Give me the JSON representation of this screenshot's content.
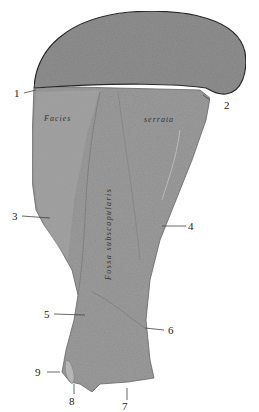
{
  "figure": {
    "colors": {
      "background": "#ffffff",
      "bone_surface": "#9a9a9a",
      "bone_surface_light": "#b0b0b0",
      "cap_surface": "#8d8d8d",
      "outline": "#2a2a2a",
      "leader_line": "#444444"
    }
  },
  "terms": {
    "facies": "Facies",
    "serrata": "serrata",
    "fossa": "Fossa subscapularis"
  },
  "labels": [
    {
      "id": "1",
      "text": "1"
    },
    {
      "id": "2",
      "text": "2"
    },
    {
      "id": "3",
      "text": "3"
    },
    {
      "id": "4",
      "text": "4"
    },
    {
      "id": "5",
      "text": "5"
    },
    {
      "id": "6",
      "text": "6"
    },
    {
      "id": "7",
      "text": "7"
    },
    {
      "id": "8",
      "text": "8"
    },
    {
      "id": "9",
      "text": "9"
    }
  ]
}
